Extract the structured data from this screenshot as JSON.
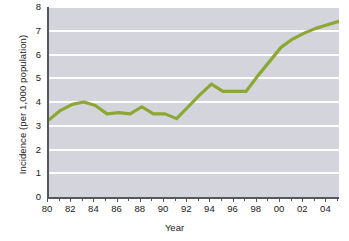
{
  "chart_data": {
    "type": "line",
    "title": "",
    "xlabel": "Year",
    "ylabel": "Incidence (per 1,000 population)",
    "xlim": [
      1980,
      2005
    ],
    "ylim": [
      0,
      8
    ],
    "ytick_labels": [
      "8",
      "7",
      "6",
      "5",
      "4",
      "3",
      "2",
      "1",
      "0"
    ],
    "ytick_values": [
      8,
      7,
      6,
      5,
      4,
      3,
      2,
      1,
      0
    ],
    "xtick_labels": [
      "80",
      "82",
      "84",
      "86",
      "88",
      "90",
      "92",
      "94",
      "96",
      "98",
      "00",
      "02",
      "04"
    ],
    "xtick_values": [
      1980,
      1982,
      1984,
      1986,
      1988,
      1990,
      1992,
      1994,
      1996,
      1998,
      2000,
      2002,
      2004
    ],
    "grid": "horizontal",
    "legend": "none",
    "line_color": "#8ca832",
    "plot_background": "#d3d4dc",
    "gridline_color": "#ffffff",
    "axis_color": "#55565e",
    "x": [
      1980,
      1981,
      1982,
      1983,
      1984,
      1985,
      1986,
      1987,
      1988,
      1989,
      1990,
      1991,
      1992,
      1993,
      1994,
      1995,
      1996,
      1997,
      1998,
      1999,
      2000,
      2001,
      2002,
      2003,
      2004,
      2005
    ],
    "values": [
      3.25,
      3.65,
      3.9,
      4.0,
      3.85,
      3.5,
      3.55,
      3.5,
      3.8,
      3.5,
      3.5,
      3.3,
      3.8,
      4.3,
      4.75,
      4.45,
      4.45,
      4.45,
      5.1,
      5.7,
      6.3,
      6.65,
      6.9,
      7.1,
      7.25,
      7.4
    ],
    "series": [
      {
        "name": "Incidence",
        "values": [
          3.25,
          3.65,
          3.9,
          4.0,
          3.85,
          3.5,
          3.55,
          3.5,
          3.8,
          3.5,
          3.5,
          3.3,
          3.8,
          4.3,
          4.75,
          4.45,
          4.45,
          4.45,
          5.1,
          5.7,
          6.3,
          6.65,
          6.9,
          7.1,
          7.25,
          7.4
        ]
      }
    ]
  }
}
